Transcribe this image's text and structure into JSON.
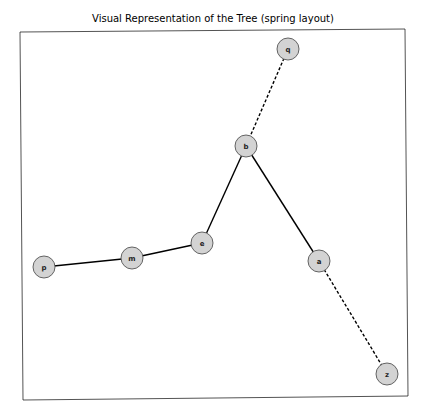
{
  "title": "Visual Representation of the Tree (spring layout)",
  "chart_data": {
    "type": "graph",
    "layout": "spring",
    "title": "Visual Representation of the Tree (spring layout)",
    "node_style": {
      "fill": "#d3d3d3",
      "stroke": "#555555",
      "label_color": "#222222"
    },
    "nodes": [
      {
        "id": "q",
        "label": "q"
      },
      {
        "id": "b",
        "label": "b"
      },
      {
        "id": "e",
        "label": "e"
      },
      {
        "id": "m",
        "label": "m"
      },
      {
        "id": "p",
        "label": "p"
      },
      {
        "id": "a",
        "label": "a"
      },
      {
        "id": "z",
        "label": "z"
      }
    ],
    "edges": [
      {
        "source": "q",
        "target": "b",
        "style": "dashed"
      },
      {
        "source": "b",
        "target": "e",
        "style": "solid"
      },
      {
        "source": "e",
        "target": "m",
        "style": "solid"
      },
      {
        "source": "m",
        "target": "p",
        "style": "solid"
      },
      {
        "source": "b",
        "target": "a",
        "style": "solid"
      },
      {
        "source": "a",
        "target": "z",
        "style": "dashed"
      }
    ]
  }
}
